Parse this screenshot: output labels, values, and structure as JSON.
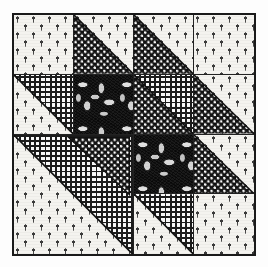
{
  "figure": {
    "background_color": "#fdfdfd",
    "ink_color": "#1a1a1a",
    "border_color": "#1a1a1a",
    "caption": ""
  },
  "block": {
    "name": "quilt-block",
    "grid_columns": 4,
    "grid_rows": 4,
    "border_width_px": 2,
    "width_px": 244,
    "height_px": 243
  },
  "fabrics": [
    {
      "key": "sprig",
      "label": "Light leaf-sprig calico",
      "value": "light",
      "ground_color": "#f4f3ef",
      "motif_color": "#3a3a3a"
    },
    {
      "key": "hound",
      "label": "Dark dotted houndstooth",
      "value": "dark",
      "ground_color": "#111111",
      "motif_color": "#ffffff"
    },
    {
      "key": "grid",
      "label": "Fine gingham grid",
      "value": "medium",
      "ground_color": "#fafafa",
      "motif_color": "#1c1c1c"
    },
    {
      "key": "leaf",
      "label": "Large dark leaf print",
      "value": "dark-feature",
      "ground_color": "#1b1b1b",
      "motif_color": "#ffffff"
    }
  ],
  "patches": [
    {
      "id": "r1c1",
      "row": 1,
      "col": 1,
      "unit": "plain",
      "fabric_a": "sprig",
      "fabric_b": null,
      "orientation": null,
      "label": "Plain square, light sprig print"
    },
    {
      "id": "r1c2",
      "row": 1,
      "col": 2,
      "unit": "half-square-triangle",
      "fabric_a": "hound",
      "fabric_b": "sprig",
      "orientation": "bl-dark",
      "label": "Half-square triangle, dark houndstooth lower-left"
    },
    {
      "id": "r1c3",
      "row": 1,
      "col": 3,
      "unit": "half-square-triangle",
      "fabric_a": "hound",
      "fabric_b": "sprig",
      "orientation": "bl-dark",
      "label": "Half-square triangle, dark houndstooth lower-left"
    },
    {
      "id": "r1c4",
      "row": 1,
      "col": 4,
      "unit": "plain",
      "fabric_a": "sprig",
      "fabric_b": null,
      "orientation": null,
      "label": "Plain square, light sprig print"
    },
    {
      "id": "r2c1",
      "row": 2,
      "col": 1,
      "unit": "half-square-triangle",
      "fabric_a": "grid",
      "fabric_b": "sprig",
      "orientation": "tr-grid",
      "label": "Half-square triangle, gingham upper-right"
    },
    {
      "id": "r2c2",
      "row": 2,
      "col": 2,
      "unit": "plain",
      "fabric_a": "leaf",
      "fabric_b": null,
      "orientation": null,
      "label": "Plain square, large leaf print"
    },
    {
      "id": "r2c3",
      "row": 2,
      "col": 3,
      "unit": "half-square-triangle",
      "fabric_a": "hound",
      "fabric_b": "grid",
      "orientation": "bl-dark",
      "label": "Half-square triangle, houndstooth lower-left, gingham upper-right"
    },
    {
      "id": "r2c4",
      "row": 2,
      "col": 4,
      "unit": "half-square-triangle",
      "fabric_a": "hound",
      "fabric_b": "sprig",
      "orientation": "bl-dark",
      "label": "Half-square triangle, houndstooth lower-left"
    },
    {
      "id": "r3c1",
      "row": 3,
      "col": 1,
      "unit": "half-square-triangle-2x2",
      "fabric_a": "grid",
      "fabric_b": "sprig",
      "orientation": "tr-grid",
      "label": "Large half-square triangle spanning two by two, gingham upper-right"
    },
    {
      "id": "r3c3",
      "row": 3,
      "col": 3,
      "unit": "plain",
      "fabric_a": "leaf",
      "fabric_b": null,
      "orientation": null,
      "label": "Plain square, large leaf print"
    },
    {
      "id": "r3c4",
      "row": 3,
      "col": 4,
      "unit": "half-square-triangle",
      "fabric_a": "hound",
      "fabric_b": "sprig",
      "orientation": "bl-dark",
      "label": "Half-square triangle, houndstooth lower-left"
    },
    {
      "id": "r4c3",
      "row": 4,
      "col": 3,
      "unit": "half-square-triangle",
      "fabric_a": "grid",
      "fabric_b": "sprig",
      "orientation": "tr-grid",
      "label": "Half-square triangle, gingham upper-right"
    },
    {
      "id": "r4c4",
      "row": 4,
      "col": 4,
      "unit": "plain",
      "fabric_a": "sprig",
      "fabric_b": null,
      "orientation": null,
      "label": "Plain square, light sprig print"
    }
  ],
  "inner_dark_triangle": {
    "present": true,
    "label": "Dark houndstooth triangle overlaid on the large gingham unit",
    "fabric": "hound"
  }
}
